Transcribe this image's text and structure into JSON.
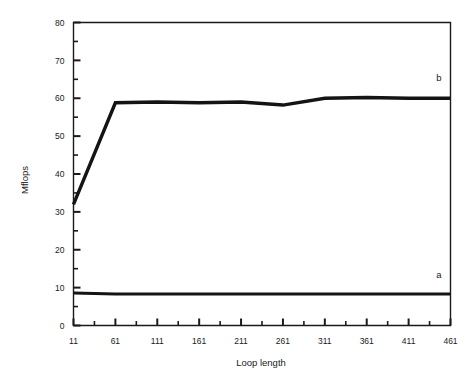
{
  "chart_data": {
    "type": "line",
    "title": "",
    "xlabel": "Loop length",
    "ylabel": "Mflops",
    "xlim": [
      11,
      461
    ],
    "ylim": [
      0,
      80
    ],
    "grid": false,
    "legend_position": "inline-right-end",
    "x_major_ticks": [
      11,
      61,
      111,
      161,
      211,
      261,
      311,
      361,
      411,
      461
    ],
    "x_tick_labels": [
      "11",
      "61",
      "111",
      "161",
      "211",
      "261",
      "311",
      "361",
      "411",
      "461"
    ],
    "x_minor_tick_step": 25,
    "y_major_ticks": [
      0,
      10,
      20,
      30,
      40,
      50,
      60,
      70,
      80
    ],
    "y_tick_labels": [
      "0",
      "10",
      "20",
      "30",
      "40",
      "50",
      "60",
      "70",
      "80"
    ],
    "y_minor_tick_step": 5,
    "x": [
      11,
      61,
      111,
      161,
      211,
      261,
      311,
      361,
      411,
      461
    ],
    "series": [
      {
        "name": "a",
        "label": "a",
        "color": "#141414",
        "line_width": 3.0,
        "values": [
          8.6,
          8.3,
          8.3,
          8.3,
          8.3,
          8.3,
          8.3,
          8.3,
          8.3,
          8.3
        ]
      },
      {
        "name": "b",
        "label": "b",
        "color": "#141414",
        "line_width": 3.4,
        "values": [
          32.0,
          58.8,
          59.0,
          58.8,
          59.0,
          58.2,
          60.0,
          60.2,
          60.0,
          60.0
        ]
      }
    ],
    "annotations": [
      {
        "text": "b",
        "x": 461,
        "y": 64.5,
        "anchor": "end"
      },
      {
        "text": "a",
        "x": 461,
        "y": 12.5,
        "anchor": "end"
      }
    ]
  },
  "figure": {
    "background_color": "#ffffff",
    "axis_color": "#1a1a1a"
  }
}
